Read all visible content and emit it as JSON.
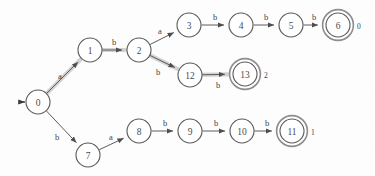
{
  "diagram": {
    "background_color": "#fdfdfd",
    "node_stroke_color": "#5a5a5a",
    "edge_color": "#5c5c5c",
    "highlight_color": "#c9c9c9",
    "start_state": "0",
    "nodes": [
      {
        "id": "n0",
        "label": "0",
        "x": 38,
        "y": 102,
        "r": 12,
        "accepting": false,
        "accept_index": ""
      },
      {
        "id": "n1",
        "label": "1",
        "x": 90,
        "y": 50,
        "r": 12,
        "accepting": false,
        "accept_index": ""
      },
      {
        "id": "n2",
        "label": "2",
        "x": 139,
        "y": 50,
        "r": 12,
        "accepting": false,
        "accept_index": ""
      },
      {
        "id": "n3",
        "label": "3",
        "x": 189,
        "y": 25,
        "r": 12,
        "accepting": false,
        "accept_index": ""
      },
      {
        "id": "n4",
        "label": "4",
        "x": 241,
        "y": 25,
        "r": 12,
        "accepting": false,
        "accept_index": ""
      },
      {
        "id": "n5",
        "label": "5",
        "x": 291,
        "y": 25,
        "r": 12,
        "accepting": false,
        "accept_index": ""
      },
      {
        "id": "n6",
        "label": "6",
        "x": 338,
        "y": 25,
        "r": 12,
        "accepting": true,
        "accept_index": "0"
      },
      {
        "id": "n7",
        "label": "7",
        "x": 88,
        "y": 155,
        "r": 12,
        "accepting": false,
        "accept_index": ""
      },
      {
        "id": "n8",
        "label": "8",
        "x": 139,
        "y": 131,
        "r": 12,
        "accepting": false,
        "accept_index": ""
      },
      {
        "id": "n9",
        "label": "9",
        "x": 190,
        "y": 131,
        "r": 12,
        "accepting": false,
        "accept_index": ""
      },
      {
        "id": "n10",
        "label": "10",
        "x": 242,
        "y": 131,
        "r": 12,
        "accepting": false,
        "accept_index": ""
      },
      {
        "id": "n11",
        "label": "11",
        "x": 292,
        "y": 131,
        "r": 12,
        "accepting": true,
        "accept_index": "1"
      },
      {
        "id": "n12",
        "label": "12",
        "x": 190,
        "y": 75,
        "r": 12,
        "accepting": false,
        "accept_index": ""
      },
      {
        "id": "n13",
        "label": "13",
        "x": 245,
        "y": 74,
        "r": 12,
        "accepting": true,
        "accept_index": "2"
      }
    ],
    "edges": [
      {
        "id": "e0_1",
        "from": "n0",
        "to": "n1",
        "label": "a",
        "label_x": 60,
        "label_y": 76,
        "highlighted": true
      },
      {
        "id": "e1_2",
        "from": "n1",
        "to": "n2",
        "label": "b",
        "label_x": 114,
        "label_y": 42,
        "highlighted": true
      },
      {
        "id": "e2_3",
        "from": "n2",
        "to": "n3",
        "label": "a",
        "label_x": 160,
        "label_y": 31,
        "highlighted": false
      },
      {
        "id": "e3_4",
        "from": "n3",
        "to": "n4",
        "label": "b",
        "label_x": 215,
        "label_y": 17,
        "highlighted": false
      },
      {
        "id": "e4_5",
        "from": "n4",
        "to": "n5",
        "label": "b",
        "label_x": 266,
        "label_y": 17,
        "highlighted": false
      },
      {
        "id": "e5_6",
        "from": "n5",
        "to": "n6",
        "label": "b",
        "label_x": 314,
        "label_y": 17,
        "highlighted": false
      },
      {
        "id": "e2_12",
        "from": "n2",
        "to": "n12",
        "label": "b",
        "label_x": 158,
        "label_y": 72,
        "highlighted": true
      },
      {
        "id": "e12_13",
        "from": "n12",
        "to": "n13",
        "label": "b",
        "label_x": 218,
        "label_y": 85,
        "highlighted": true
      },
      {
        "id": "e0_7",
        "from": "n0",
        "to": "n7",
        "label": "b",
        "label_x": 57,
        "label_y": 137,
        "highlighted": false
      },
      {
        "id": "e7_8",
        "from": "n7",
        "to": "n8",
        "label": "a",
        "label_x": 111,
        "label_y": 137,
        "highlighted": false
      },
      {
        "id": "e8_9",
        "from": "n8",
        "to": "n9",
        "label": "b",
        "label_x": 165,
        "label_y": 123,
        "highlighted": false
      },
      {
        "id": "e9_10",
        "from": "n9",
        "to": "n10",
        "label": "b",
        "label_x": 216,
        "label_y": 123,
        "highlighted": false
      },
      {
        "id": "e10_11",
        "from": "n10",
        "to": "n11",
        "label": "b",
        "label_x": 267,
        "label_y": 123,
        "highlighted": false
      }
    ],
    "start_arrow": {
      "x1": 19,
      "y1": 102,
      "x2": 25,
      "y2": 102
    },
    "highlighted_path": [
      "0",
      "1",
      "2",
      "12",
      "13"
    ],
    "accepting_states": [
      "6",
      "11",
      "13"
    ],
    "alphabet": [
      "a",
      "b"
    ]
  }
}
